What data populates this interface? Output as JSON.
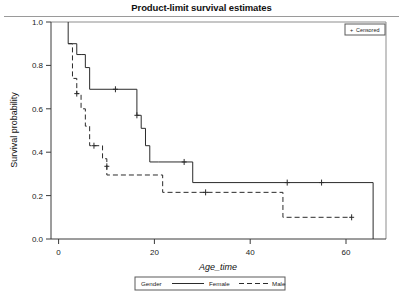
{
  "chart_data": {
    "type": "line",
    "title": "Product-limit survival estimates",
    "xlabel": "Age_time",
    "ylabel": "Survival probability",
    "xlim": [
      -3,
      75
    ],
    "ylim": [
      0.0,
      1.0
    ],
    "xticks": [
      0,
      20,
      40,
      60
    ],
    "xtick_labels": [
      "0",
      "20",
      "40",
      "60"
    ],
    "yticks": [
      0.0,
      0.2,
      0.4,
      0.6,
      0.8,
      1.0
    ],
    "ytick_labels": [
      "0.0",
      "0.2",
      "0.4",
      "0.6",
      "0.8",
      "1.0"
    ],
    "grid": false,
    "legend_position": "bottom",
    "curve_style": "step-post",
    "series": [
      {
        "name": "Female",
        "linestyle": "solid",
        "color": "#2b2b2b",
        "x": [
          1,
          1,
          2,
          3,
          4,
          5,
          6,
          12,
          17,
          18,
          19,
          20,
          22,
          30,
          72,
          72
        ],
        "y": [
          1.0,
          0.9,
          0.9,
          0.85,
          0.85,
          0.79,
          0.69,
          0.69,
          0.57,
          0.51,
          0.43,
          0.355,
          0.355,
          0.26,
          0.26,
          0.0
        ],
        "censored_x": [
          12,
          17,
          28,
          52,
          60
        ],
        "censored_y": [
          0.69,
          0.57,
          0.355,
          0.26,
          0.26
        ]
      },
      {
        "name": "Male",
        "linestyle": "dashed",
        "color": "#2b2b2b",
        "x": [
          1,
          2,
          3,
          4,
          5,
          6,
          9,
          10,
          22,
          23,
          50,
          51,
          67
        ],
        "y": [
          0.9,
          0.74,
          0.67,
          0.6,
          0.52,
          0.43,
          0.37,
          0.295,
          0.295,
          0.215,
          0.215,
          0.1,
          0.1
        ],
        "censored_x": [
          3,
          7,
          10,
          33,
          67
        ],
        "censored_y": [
          0.67,
          0.43,
          0.335,
          0.215,
          0.1
        ]
      }
    ],
    "censored_legend": {
      "marker": "+",
      "label": "Censored"
    },
    "bottom_legend": {
      "title": "Gender",
      "entries": [
        {
          "label": "Female",
          "linestyle": "solid"
        },
        {
          "label": "Male",
          "linestyle": "dashed"
        }
      ]
    }
  },
  "figure": {
    "background": "#ffffff",
    "axis_color": "#3a3a3a",
    "line_color": "#2b2b2b"
  }
}
